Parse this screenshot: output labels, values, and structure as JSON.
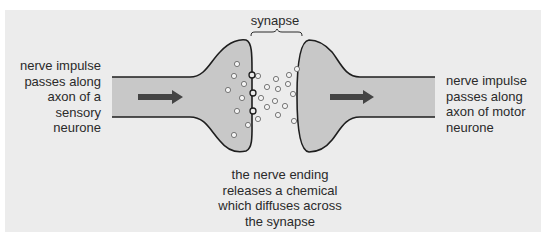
{
  "figure": {
    "colors": {
      "panel_background": "#ececec",
      "neurone_fill": "#c8c8c8",
      "outline": "#1e1e1e",
      "arrow": "#444444",
      "vesicle_stroke": "#6a6a6a",
      "vesicle_fill": "#f4f4f4",
      "text": "#2a2a2a"
    }
  },
  "labels": {
    "synapse": "synapse",
    "left": {
      "lines": [
        "nerve impulse",
        "passes along",
        "axon of a",
        "sensory",
        "neurone"
      ]
    },
    "right": {
      "lines": [
        "nerve impulse",
        "passes along",
        "axon of motor",
        "neurone"
      ]
    },
    "bottom": {
      "lines": [
        "the nerve ending",
        "releases a chemical",
        "which diffuses across",
        "the synapse"
      ]
    }
  },
  "structures": {
    "sensory_neurone": {
      "name": "axon of sensory neurone",
      "arrow_direction": "right"
    },
    "motor_neurone": {
      "name": "axon of motor neurone",
      "arrow_direction": "right"
    },
    "synapse_gap": {
      "name": "synapse"
    }
  },
  "vesicles": {
    "inside_terminal": [
      [
        237,
        64
      ],
      [
        234,
        76
      ],
      [
        244,
        84
      ],
      [
        228,
        90
      ],
      [
        242,
        98
      ],
      [
        237,
        111
      ],
      [
        248,
        125
      ],
      [
        234,
        135
      ]
    ],
    "at_membrane": [
      [
        252,
        75
      ],
      [
        253,
        93
      ],
      [
        253,
        111
      ]
    ],
    "in_cleft": [
      [
        258,
        76
      ],
      [
        276,
        79
      ],
      [
        267,
        87
      ],
      [
        278,
        89
      ],
      [
        289,
        75
      ],
      [
        288,
        84
      ],
      [
        261,
        98
      ],
      [
        275,
        101
      ],
      [
        267,
        107
      ],
      [
        285,
        106
      ],
      [
        278,
        115
      ],
      [
        258,
        119
      ],
      [
        293,
        94
      ],
      [
        294,
        121
      ],
      [
        297,
        69
      ]
    ]
  }
}
